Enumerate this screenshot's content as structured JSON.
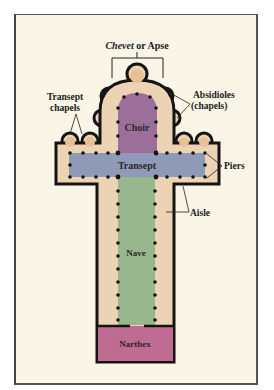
{
  "diagram": {
    "title_italic": "Chevet",
    "title_rest": " or Apse",
    "labels": {
      "transept_chapels_1": "Transept",
      "transept_chapels_2": "chapels",
      "absidioles_1": "Absidioles",
      "absidioles_2": "(chapels)",
      "piers": "Piers",
      "aisle": "Aisle"
    },
    "regions": {
      "choir": "Choir",
      "transept": "Transept",
      "nave": "Nave",
      "narthex": "Narthex"
    },
    "colors": {
      "background": "#fbf5e8",
      "building_fill": "#ecd3b4",
      "chapel_fill": "#e7c193",
      "choir": "#9c6f9a",
      "transept": "#8f99b8",
      "nave": "#98b78c",
      "narthex": "#c06b92",
      "outline": "#141414"
    }
  }
}
